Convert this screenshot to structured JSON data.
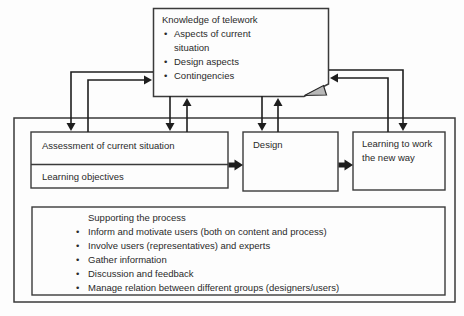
{
  "knowledge_box": {
    "title": "Knowledge of telework",
    "bullets": [
      "Aspects of current situation",
      "Design aspects",
      "Contingencies"
    ]
  },
  "assessment_box": {
    "row1": "Assessment of current situation",
    "row2": "Learning objectives"
  },
  "design_box": {
    "label": "Design"
  },
  "learning_box": {
    "label": "Learning to work the new way"
  },
  "supporting_box": {
    "title": "Supporting the process",
    "bullets": [
      "Inform and motivate users (both on content and process)",
      "Involve users (representatives) and experts",
      "Gather information",
      "Discussion and feedback",
      "Manage relation between different groups (designers/users)"
    ]
  },
  "colors": {
    "box_border": "#3a3a3a",
    "arrow": "#1e1e1e",
    "text": "#2a2a2a",
    "fold_fill": "#b8b8b8",
    "background": "#fdfdfd"
  }
}
